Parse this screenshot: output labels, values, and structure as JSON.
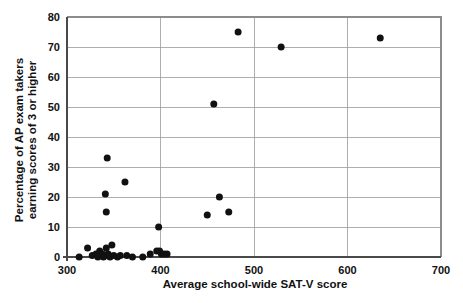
{
  "chart_data": {
    "type": "scatter",
    "title": "",
    "xlabel": "Average school-wide SAT-V score",
    "ylabel": "Percentage of AP exam takers earning scores of 3 or higher",
    "ylabel_line1": "Percentage of AP exam takers",
    "ylabel_line2": "earning scores of 3 or higher",
    "xlim": [
      300,
      700
    ],
    "ylim": [
      0,
      80
    ],
    "xticks": [
      300,
      400,
      500,
      600,
      700
    ],
    "yticks": [
      0,
      10,
      20,
      30,
      40,
      50,
      60,
      70,
      80
    ],
    "xtick_labels": [
      "300",
      "400",
      "500",
      "600",
      "700"
    ],
    "ytick_labels": [
      "0",
      "10",
      "20",
      "30",
      "40",
      "50",
      "60",
      "70",
      "80"
    ],
    "grid": "horizontal-and-vertical",
    "legend": "none",
    "marker": "filled-circle",
    "marker_color": "#111111",
    "marker_size_px": 7,
    "points": [
      {
        "x": 313,
        "y": 0
      },
      {
        "x": 322,
        "y": 3
      },
      {
        "x": 327,
        "y": 0.5
      },
      {
        "x": 331,
        "y": 1
      },
      {
        "x": 333,
        "y": 0
      },
      {
        "x": 335,
        "y": 2
      },
      {
        "x": 336,
        "y": 0.5
      },
      {
        "x": 338,
        "y": 1
      },
      {
        "x": 339,
        "y": 0
      },
      {
        "x": 341,
        "y": 0.5
      },
      {
        "x": 342,
        "y": 3
      },
      {
        "x": 343,
        "y": 33
      },
      {
        "x": 341,
        "y": 21
      },
      {
        "x": 342,
        "y": 15
      },
      {
        "x": 344,
        "y": 1
      },
      {
        "x": 346,
        "y": 0
      },
      {
        "x": 348,
        "y": 4
      },
      {
        "x": 350,
        "y": 0.5
      },
      {
        "x": 354,
        "y": 0
      },
      {
        "x": 357,
        "y": 0.5
      },
      {
        "x": 362,
        "y": 25
      },
      {
        "x": 364,
        "y": 0.5
      },
      {
        "x": 370,
        "y": 0
      },
      {
        "x": 381,
        "y": 0
      },
      {
        "x": 389,
        "y": 1
      },
      {
        "x": 396,
        "y": 2
      },
      {
        "x": 398,
        "y": 10
      },
      {
        "x": 399,
        "y": 2
      },
      {
        "x": 401,
        "y": 1
      },
      {
        "x": 404,
        "y": 1
      },
      {
        "x": 407,
        "y": 1
      },
      {
        "x": 450,
        "y": 14
      },
      {
        "x": 457,
        "y": 51
      },
      {
        "x": 463,
        "y": 20
      },
      {
        "x": 473,
        "y": 15
      },
      {
        "x": 483,
        "y": 75
      },
      {
        "x": 529,
        "y": 70
      },
      {
        "x": 635,
        "y": 73
      }
    ]
  }
}
